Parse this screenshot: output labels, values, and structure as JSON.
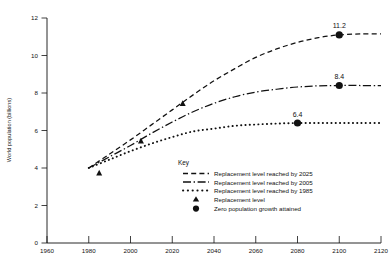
{
  "chart_data": {
    "type": "line",
    "title": "",
    "xlabel": "",
    "ylabel": "World population (billions)",
    "xlim": [
      1960,
      2120
    ],
    "ylim": [
      0,
      12
    ],
    "xticks": [
      1960,
      1980,
      2000,
      2020,
      2040,
      2060,
      2080,
      2100,
      2120
    ],
    "yticks": [
      0,
      2,
      4,
      6,
      8,
      10,
      12
    ],
    "grid": false,
    "legend_position": "inside-lower-right",
    "series": [
      {
        "name": "Replacement level reached by 2025",
        "style": "dashed",
        "x": [
          1980,
          1990,
          2000,
          2010,
          2020,
          2030,
          2040,
          2050,
          2060,
          2070,
          2080,
          2090,
          2100,
          2110,
          2120
        ],
        "values": [
          4.0,
          4.75,
          5.5,
          6.3,
          7.1,
          7.9,
          8.65,
          9.3,
          9.9,
          10.35,
          10.7,
          10.95,
          11.1,
          11.15,
          11.15
        ]
      },
      {
        "name": "Replacement level reached by 2005",
        "style": "dash-dot",
        "x": [
          1980,
          1990,
          2000,
          2010,
          2020,
          2030,
          2040,
          2050,
          2060,
          2070,
          2080,
          2090,
          2100,
          2110,
          2120
        ],
        "values": [
          4.0,
          4.6,
          5.2,
          5.85,
          6.45,
          7.0,
          7.45,
          7.8,
          8.05,
          8.2,
          8.32,
          8.38,
          8.4,
          8.4,
          8.4
        ]
      },
      {
        "name": "Replacement level reached by 1985",
        "style": "dotted",
        "x": [
          1980,
          1990,
          2000,
          2010,
          2020,
          2030,
          2040,
          2050,
          2060,
          2070,
          2080,
          2090,
          2100,
          2110,
          2120
        ],
        "values": [
          4.0,
          4.45,
          4.9,
          5.3,
          5.65,
          5.95,
          6.1,
          6.25,
          6.32,
          6.37,
          6.4,
          6.4,
          6.4,
          6.4,
          6.4
        ]
      }
    ],
    "replacement_markers": [
      {
        "series": "Replacement level reached by 1985",
        "x": 1985,
        "y": 3.75
      },
      {
        "series": "Replacement level reached by 2005",
        "x": 2005,
        "y": 5.45
      },
      {
        "series": "Replacement level reached by 2025",
        "x": 2025,
        "y": 7.45
      }
    ],
    "zero_growth_markers": [
      {
        "series": "Replacement level reached by 2025",
        "x": 2100,
        "y": 11.1,
        "label": "11.2"
      },
      {
        "series": "Replacement level reached by 2005",
        "x": 2100,
        "y": 8.4,
        "label": "8.4"
      },
      {
        "series": "Replacement level reached by 1985",
        "x": 2080,
        "y": 6.4,
        "label": "6.4"
      }
    ],
    "annotations": [
      "11.2",
      "8.4",
      "6.4"
    ]
  },
  "axes": {
    "y_title": "World population (billions)",
    "y_tick_labels": [
      "0",
      "2",
      "4",
      "6",
      "8",
      "10",
      "12"
    ],
    "x_tick_labels": [
      "1960",
      "1980",
      "2000",
      "2020",
      "2040",
      "2060",
      "2080",
      "2100",
      "2120"
    ]
  },
  "legend": {
    "title": "Key",
    "entries": [
      {
        "label": "Replacement level reached by 2025",
        "symbol": "dashed-line-swatch"
      },
      {
        "label": "Replacement level reached by 2005",
        "symbol": "dash-dot-line-swatch"
      },
      {
        "label": "Replacement level reached by 1985",
        "symbol": "dotted-line-swatch"
      },
      {
        "label": "Replacement level",
        "symbol": "triangle-marker"
      },
      {
        "label": "Zero population growth attained",
        "symbol": "circle-marker"
      }
    ]
  },
  "point_labels": {
    "high": "11.2",
    "mid": "8.4",
    "low": "6.4"
  },
  "colors": {
    "ink": "#111111",
    "background": "#ffffff"
  }
}
